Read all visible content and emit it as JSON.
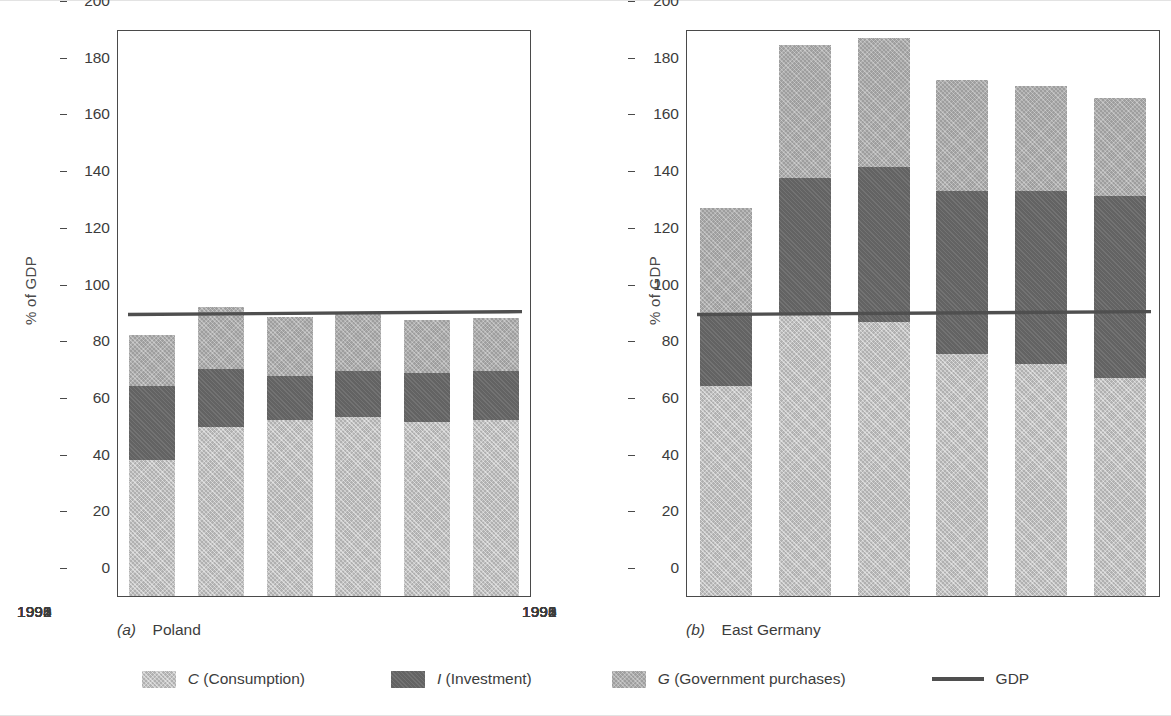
{
  "figure": {
    "y_axis_title": "% of GDP",
    "y_ticks": [
      0,
      20,
      40,
      60,
      80,
      100,
      120,
      140,
      160,
      180,
      200
    ],
    "colors": {
      "consumption": "#b0b0b0",
      "investment": "#636363",
      "government": "#9e9e9e",
      "gdp_line": "#4f4f4f",
      "axis": "#4a4a4a",
      "text": "#3c3c3c",
      "background": "#ffffff"
    }
  },
  "panels": [
    {
      "caption_letter": "(a)",
      "caption_text": "Poland",
      "caption_full": "(a)  Poland"
    },
    {
      "caption_letter": "(b)",
      "caption_text": "East Germany",
      "caption_full": "(b)  East Germany"
    }
  ],
  "legend": {
    "items": [
      {
        "marker": "swatch",
        "symbol": "C",
        "label": " (Consumption)",
        "color": "#b0b0b0",
        "name": "legend-consumption"
      },
      {
        "marker": "swatch",
        "symbol": "I",
        "label": " (Investment)",
        "color": "#636363",
        "name": "legend-investment"
      },
      {
        "marker": "swatch",
        "symbol": "G",
        "label": " (Government purchases)",
        "color": "#9e9e9e",
        "name": "legend-government"
      },
      {
        "marker": "line",
        "symbol": "",
        "label": "GDP",
        "color": "#4f4f4f",
        "name": "legend-gdp"
      }
    ]
  },
  "chart_data": [
    {
      "type": "bar",
      "subtype": "stacked-bar-with-line",
      "title": "(a) Poland",
      "xlabel": "",
      "ylabel": "% of GDP",
      "ylim": [
        0,
        200
      ],
      "yticks": [
        0,
        20,
        40,
        60,
        80,
        100,
        120,
        140,
        160,
        180,
        200
      ],
      "grid": false,
      "legend_position": "bottom-shared",
      "categories": [
        "1990",
        "1991",
        "1992",
        "1993",
        "1994",
        "1995"
      ],
      "series": [
        {
          "name": "C (Consumption)",
          "values": [
            48,
            59.5,
            62,
            63,
            61.5,
            62
          ]
        },
        {
          "name": "I (Investment)",
          "values": [
            26,
            20.5,
            15.5,
            16.5,
            17,
            17.5
          ]
        },
        {
          "name": "G (Government purchases)",
          "values": [
            18,
            22,
            21,
            20.5,
            19,
            18.5
          ]
        }
      ],
      "totals": [
        92,
        102,
        98.5,
        100,
        97.5,
        98
      ],
      "line_series": {
        "name": "GDP",
        "values": [
          100,
          100.2,
          100.4,
          100.6,
          100.8,
          101
        ]
      }
    },
    {
      "type": "bar",
      "subtype": "stacked-bar-with-line",
      "title": "(b) East Germany",
      "xlabel": "",
      "ylabel": "% of GDP",
      "ylim": [
        0,
        200
      ],
      "yticks": [
        0,
        20,
        40,
        60,
        80,
        100,
        120,
        140,
        160,
        180,
        200
      ],
      "grid": false,
      "legend_position": "bottom-shared",
      "categories": [
        "1990",
        "1991",
        "1992",
        "1993",
        "1994",
        "1995"
      ],
      "series": [
        {
          "name": "C (Consumption)",
          "values": [
            74,
            99.5,
            96.5,
            85.5,
            82,
            77
          ]
        },
        {
          "name": "I (Investment)",
          "values": [
            26,
            48,
            55,
            57.5,
            61,
            64
          ]
        },
        {
          "name": "G (Government purchases)",
          "values": [
            37,
            47,
            45.5,
            39,
            37,
            34.5
          ]
        }
      ],
      "totals": [
        137,
        194.5,
        197,
        182,
        180,
        175.5
      ],
      "line_series": {
        "name": "GDP",
        "values": [
          100,
          100.2,
          100.4,
          100.6,
          100.8,
          101
        ]
      }
    }
  ]
}
